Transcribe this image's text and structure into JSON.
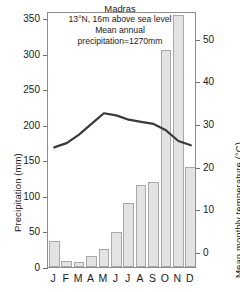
{
  "chart_data": {
    "type": "bar",
    "title": "Madras",
    "subtitle_lines": [
      "13°N, 16m above sea level",
      "Mean annual",
      "precipitation=1270mm"
    ],
    "location": "Madras",
    "latitude": "13°N",
    "elevation": "16m above sea level",
    "mean_annual_precipitation": "1270mm",
    "categories": [
      "J",
      "F",
      "M",
      "A",
      "M",
      "J",
      "J",
      "A",
      "S",
      "O",
      "N",
      "D"
    ],
    "month_names": [
      "January",
      "February",
      "March",
      "April",
      "May",
      "June",
      "July",
      "August",
      "September",
      "October",
      "November",
      "December"
    ],
    "xlabel": "",
    "grid": false,
    "legend": "none",
    "series": [
      {
        "name": "Precipitation",
        "type": "bar",
        "unit": "mm",
        "axis": "left",
        "values": [
          36,
          9,
          7,
          15,
          25,
          49,
          90,
          115,
          119,
          305,
          355,
          140
        ]
      },
      {
        "name": "Mean monthly temperature",
        "type": "line",
        "unit": "°C",
        "axis": "right",
        "values": [
          25.0,
          26.0,
          28.0,
          30.5,
          33.0,
          32.5,
          31.5,
          31.0,
          30.5,
          29.0,
          26.5,
          25.5
        ]
      }
    ],
    "left_axis": {
      "label": "Precipitation (mm)",
      "ylim": [
        0,
        360
      ],
      "ticks": [
        0,
        50,
        100,
        150,
        200,
        250,
        300,
        350
      ],
      "tick_labels": [
        "0",
        "50",
        "100",
        "150",
        "200",
        "250",
        "300",
        "350"
      ]
    },
    "right_axis": {
      "label": "Mean monthly temperature (°C)",
      "ylim": [
        -3.5,
        56.5
      ],
      "ticks": [
        0,
        10,
        20,
        30,
        40,
        50
      ],
      "tick_labels": [
        "0",
        "10",
        "20",
        "30",
        "40",
        "50"
      ]
    }
  },
  "colors": {
    "bar_fill": "#e3e3e3",
    "bar_stroke": "#a8a8a8",
    "line": "#3a3a3a",
    "axis": "#8d8d8d",
    "text": "#1a1a1a",
    "background": "#ffffff"
  }
}
